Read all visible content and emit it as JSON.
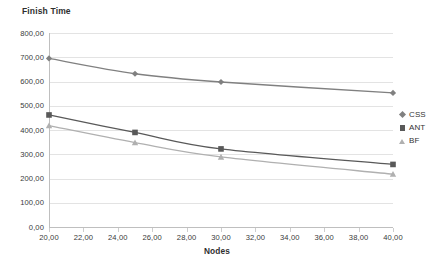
{
  "chart_data": {
    "type": "line",
    "title": "",
    "ylabel": "Finish Time",
    "xlabel": "Nodes",
    "x": [
      20,
      25,
      30,
      40
    ],
    "xlim": [
      20,
      40
    ],
    "ylim": [
      0,
      800
    ],
    "grid": true,
    "legend_position": "right",
    "xticks": [
      "20,00",
      "22,00",
      "24,00",
      "26,00",
      "28,00",
      "30,00",
      "32,00",
      "34,00",
      "36,00",
      "38,00",
      "40,00"
    ],
    "xtick_values": [
      20,
      22,
      24,
      26,
      28,
      30,
      32,
      34,
      36,
      38,
      40
    ],
    "yticks": [
      "0,00",
      "100,00",
      "200,00",
      "300,00",
      "400,00",
      "500,00",
      "600,00",
      "700,00",
      "800,00"
    ],
    "ytick_values": [
      0,
      100,
      200,
      300,
      400,
      500,
      600,
      700,
      800
    ],
    "series": [
      {
        "name": "CSS",
        "marker": "diamond",
        "color": "#808080",
        "values": [
          695,
          632,
          598,
          553
        ]
      },
      {
        "name": "ANT",
        "marker": "square",
        "color": "#595959",
        "values": [
          462,
          390,
          322,
          258
        ]
      },
      {
        "name": "BF",
        "marker": "triangle",
        "color": "#b0b0b0",
        "values": [
          418,
          348,
          289,
          218
        ]
      }
    ]
  },
  "legend": {
    "items": [
      {
        "label": "CSS",
        "marker": "diamond",
        "color": "#808080"
      },
      {
        "label": "ANT",
        "marker": "square",
        "color": "#595959"
      },
      {
        "label": "BF",
        "marker": "triangle",
        "color": "#b0b0b0"
      }
    ]
  },
  "axes": {
    "y_title": "Finish Time",
    "x_title": "Nodes"
  }
}
